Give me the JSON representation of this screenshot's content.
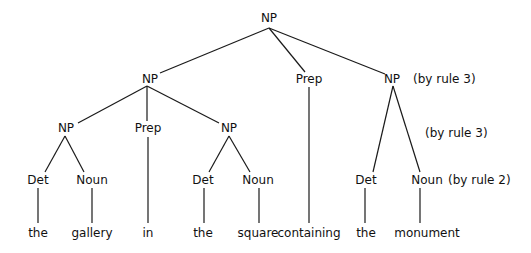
{
  "diagram": {
    "type": "parse-tree",
    "nodes": [
      {
        "id": "np_root",
        "label": "NP",
        "x": 269,
        "y": 18
      },
      {
        "id": "np_left",
        "label": "NP",
        "x": 150,
        "y": 79
      },
      {
        "id": "prep_top",
        "label": "Prep",
        "x": 309,
        "y": 79
      },
      {
        "id": "np_right",
        "label": "NP",
        "x": 392,
        "y": 79
      },
      {
        "id": "np_ll",
        "label": "NP",
        "x": 66,
        "y": 128
      },
      {
        "id": "prep_in",
        "label": "Prep",
        "x": 148,
        "y": 128
      },
      {
        "id": "np_lr",
        "label": "NP",
        "x": 229,
        "y": 128
      },
      {
        "id": "det1",
        "label": "Det",
        "x": 38,
        "y": 180
      },
      {
        "id": "noun1",
        "label": "Noun",
        "x": 92,
        "y": 180
      },
      {
        "id": "det2",
        "label": "Det",
        "x": 203,
        "y": 180
      },
      {
        "id": "noun2",
        "label": "Noun",
        "x": 258,
        "y": 180
      },
      {
        "id": "det3",
        "label": "Det",
        "x": 366,
        "y": 180
      },
      {
        "id": "noun3",
        "label": "Noun",
        "x": 427,
        "y": 180
      }
    ],
    "words": [
      {
        "text": "the",
        "x": 38,
        "y": 233
      },
      {
        "text": "gallery",
        "x": 92,
        "y": 233
      },
      {
        "text": "in",
        "x": 148,
        "y": 233
      },
      {
        "text": "the",
        "x": 203,
        "y": 233
      },
      {
        "text": "square",
        "x": 258,
        "y": 233
      },
      {
        "text": "containing",
        "x": 309,
        "y": 233
      },
      {
        "text": "the",
        "x": 366,
        "y": 233
      },
      {
        "text": "monument",
        "x": 427,
        "y": 233
      }
    ],
    "annotations": [
      {
        "text": "(by rule 3)",
        "x": 413,
        "y": 79
      },
      {
        "text": "(by rule 3)",
        "x": 425,
        "y": 133
      },
      {
        "text": "(by rule 2)",
        "x": 448,
        "y": 180
      }
    ],
    "edges": [
      {
        "from": "np_root",
        "to": "np_left",
        "x1": 269,
        "y1": 28,
        "x2": 160,
        "y2": 73
      },
      {
        "from": "np_root",
        "to": "prep_top",
        "x1": 269,
        "y1": 28,
        "x2": 305,
        "y2": 72
      },
      {
        "from": "np_root",
        "to": "np_right",
        "x1": 269,
        "y1": 28,
        "x2": 385,
        "y2": 74
      },
      {
        "from": "np_left",
        "to": "np_ll",
        "x1": 147,
        "y1": 86,
        "x2": 78,
        "y2": 123
      },
      {
        "from": "np_left",
        "to": "prep_in",
        "x1": 147,
        "y1": 86,
        "x2": 147,
        "y2": 121
      },
      {
        "from": "np_left",
        "to": "np_lr",
        "x1": 147,
        "y1": 86,
        "x2": 219,
        "y2": 123
      },
      {
        "from": "np_ll",
        "to": "det1",
        "x1": 65,
        "y1": 136,
        "x2": 45,
        "y2": 172
      },
      {
        "from": "np_ll",
        "to": "noun1",
        "x1": 65,
        "y1": 136,
        "x2": 84,
        "y2": 172
      },
      {
        "from": "np_lr",
        "to": "det2",
        "x1": 229,
        "y1": 136,
        "x2": 209,
        "y2": 172
      },
      {
        "from": "np_lr",
        "to": "noun2",
        "x1": 229,
        "y1": 136,
        "x2": 250,
        "y2": 172
      },
      {
        "from": "np_right",
        "to": "det3",
        "x1": 393,
        "y1": 86,
        "x2": 373,
        "y2": 172
      },
      {
        "from": "np_right",
        "to": "noun3",
        "x1": 393,
        "y1": 86,
        "x2": 420,
        "y2": 172
      },
      {
        "from": "det1",
        "to": "w_the1",
        "x1": 38,
        "y1": 188,
        "x2": 38,
        "y2": 223
      },
      {
        "from": "noun1",
        "to": "w_gallery",
        "x1": 92,
        "y1": 188,
        "x2": 92,
        "y2": 223
      },
      {
        "from": "prep_in",
        "to": "w_in",
        "x1": 148,
        "y1": 137,
        "x2": 148,
        "y2": 223
      },
      {
        "from": "det2",
        "to": "w_the2",
        "x1": 204,
        "y1": 188,
        "x2": 204,
        "y2": 223
      },
      {
        "from": "noun2",
        "to": "w_square",
        "x1": 259,
        "y1": 188,
        "x2": 259,
        "y2": 223
      },
      {
        "from": "prep_top",
        "to": "w_containing",
        "x1": 309,
        "y1": 87,
        "x2": 309,
        "y2": 223
      },
      {
        "from": "det3",
        "to": "w_the3",
        "x1": 365,
        "y1": 188,
        "x2": 365,
        "y2": 223
      },
      {
        "from": "noun3",
        "to": "w_monument",
        "x1": 420,
        "y1": 188,
        "x2": 420,
        "y2": 223
      }
    ]
  }
}
